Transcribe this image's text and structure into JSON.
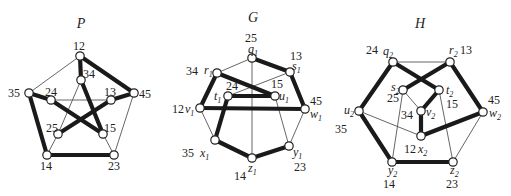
{
  "graphs": [
    {
      "id": "P",
      "title": "P",
      "title_pos": [
        81,
        28
      ],
      "nodes": [
        {
          "id": "12",
          "x": 80,
          "y": 56,
          "num": "12",
          "nx": 73,
          "ny": 50
        },
        {
          "id": "34",
          "x": 81,
          "y": 80,
          "num": "34",
          "nx": 83,
          "ny": 78
        },
        {
          "id": "35",
          "x": 29,
          "y": 93,
          "num": "35",
          "nx": 8,
          "ny": 97
        },
        {
          "id": "24",
          "x": 51,
          "y": 100,
          "num": "24",
          "nx": 45,
          "ny": 96
        },
        {
          "id": "13",
          "x": 111,
          "y": 100,
          "num": "13",
          "nx": 104,
          "ny": 96
        },
        {
          "id": "45",
          "x": 134,
          "y": 93,
          "num": "45",
          "nx": 139,
          "ny": 98
        },
        {
          "id": "25",
          "x": 58,
          "y": 134,
          "num": "25",
          "nx": 46,
          "ny": 132
        },
        {
          "id": "15",
          "x": 103,
          "y": 134,
          "num": "15",
          "nx": 104,
          "ny": 132
        },
        {
          "id": "14",
          "x": 47,
          "y": 155,
          "num": "14",
          "nx": 40,
          "ny": 170
        },
        {
          "id": "23",
          "x": 114,
          "y": 155,
          "num": "23",
          "nx": 108,
          "ny": 170
        }
      ],
      "thick": [
        [
          "12",
          "34"
        ],
        [
          "12",
          "45"
        ],
        [
          "45",
          "13"
        ],
        [
          "13",
          "25"
        ],
        [
          "35",
          "24"
        ],
        [
          "24",
          "15"
        ],
        [
          "34",
          "15"
        ],
        [
          "35",
          "14"
        ],
        [
          "14",
          "23"
        ]
      ],
      "thin": [
        [
          "12",
          "35"
        ],
        [
          "45",
          "23"
        ],
        [
          "24",
          "13"
        ],
        [
          "34",
          "25"
        ],
        [
          "25",
          "14"
        ],
        [
          "15",
          "23"
        ]
      ]
    },
    {
      "id": "G",
      "title": "G",
      "title_pos": [
        253,
        22
      ],
      "nodes": [
        {
          "id": "q1",
          "x": 252,
          "y": 58,
          "num": "25",
          "nx": 245,
          "ny": 42,
          "var": "q",
          "vx": 248,
          "vy": 53
        },
        {
          "id": "r1",
          "x": 217,
          "y": 73,
          "num": "34",
          "nx": 186,
          "ny": 75,
          "var": "r",
          "vx": 204,
          "vy": 74
        },
        {
          "id": "s1",
          "x": 290,
          "y": 72,
          "num": "13",
          "nx": 290,
          "ny": 60,
          "var": "s",
          "vx": 292,
          "vy": 70
        },
        {
          "id": "t1",
          "x": 228,
          "y": 96,
          "num": "24",
          "nx": 226,
          "ny": 90,
          "var": "t",
          "vx": 214,
          "vy": 100
        },
        {
          "id": "u1",
          "x": 275,
          "y": 96,
          "num": "15",
          "nx": 271,
          "ny": 88,
          "var": "u",
          "vx": 279,
          "vy": 100
        },
        {
          "id": "v1",
          "x": 200,
          "y": 108,
          "num": "12",
          "nx": 172,
          "ny": 113,
          "var": "v",
          "vx": 185,
          "vy": 113
        },
        {
          "id": "w1",
          "x": 305,
          "y": 109,
          "num": "45",
          "nx": 310,
          "ny": 105,
          "var": "w",
          "vx": 310,
          "vy": 118
        },
        {
          "id": "x1",
          "x": 215,
          "y": 140,
          "num": "35",
          "nx": 182,
          "ny": 157,
          "var": "x",
          "vx": 200,
          "vy": 157
        },
        {
          "id": "y1",
          "x": 289,
          "y": 146,
          "num": "23",
          "nx": 294,
          "ny": 171,
          "var": "y",
          "vx": 293,
          "vy": 156
        },
        {
          "id": "z1",
          "x": 252,
          "y": 158,
          "num": "14",
          "nx": 234,
          "ny": 180,
          "var": "z",
          "vx": 248,
          "vy": 172
        }
      ],
      "thick": [
        [
          "q1",
          "s1"
        ],
        [
          "r1",
          "u1"
        ],
        [
          "r1",
          "v1"
        ],
        [
          "s1",
          "w1"
        ],
        [
          "t1",
          "u1"
        ],
        [
          "v1",
          "w1"
        ],
        [
          "t1",
          "x1"
        ],
        [
          "x1",
          "z1"
        ],
        [
          "z1",
          "y1"
        ]
      ],
      "thin": [
        [
          "q1",
          "r1"
        ],
        [
          "q1",
          "z1"
        ],
        [
          "s1",
          "t1"
        ],
        [
          "v1",
          "x1"
        ],
        [
          "u1",
          "y1"
        ],
        [
          "w1",
          "y1"
        ]
      ]
    },
    {
      "id": "H",
      "title": "H",
      "title_pos": [
        420,
        28
      ],
      "nodes": [
        {
          "id": "q2",
          "x": 393,
          "y": 62,
          "num": "24",
          "nx": 366,
          "ny": 54,
          "var": "q",
          "vx": 383,
          "vy": 55
        },
        {
          "id": "r2",
          "x": 450,
          "y": 62,
          "num": "13",
          "nx": 460,
          "ny": 54,
          "var": "r",
          "vx": 449,
          "vy": 54
        },
        {
          "id": "s2",
          "x": 403,
          "y": 90,
          "num": "25",
          "nx": 387,
          "ny": 102,
          "var": "s",
          "vx": 391,
          "vy": 91
        },
        {
          "id": "t2",
          "x": 439,
          "y": 90,
          "num": "15",
          "nx": 446,
          "ny": 108,
          "var": "t",
          "vx": 446,
          "vy": 94
        },
        {
          "id": "u2",
          "x": 359,
          "y": 111,
          "num": "35",
          "nx": 335,
          "ny": 133,
          "var": "u",
          "vx": 344,
          "vy": 114
        },
        {
          "id": "v2",
          "x": 421,
          "y": 111,
          "num": "34",
          "nx": 401,
          "ny": 119,
          "var": "v",
          "vx": 426,
          "vy": 116
        },
        {
          "id": "w2",
          "x": 483,
          "y": 112,
          "num": "45",
          "nx": 488,
          "ny": 104,
          "var": "w",
          "vx": 489,
          "vy": 117
        },
        {
          "id": "x2",
          "x": 421,
          "y": 136,
          "num": "12",
          "nx": 404,
          "ny": 153,
          "var": "x",
          "vx": 418,
          "vy": 153
        },
        {
          "id": "y2",
          "x": 392,
          "y": 162,
          "num": "14",
          "nx": 383,
          "ny": 188,
          "var": "y",
          "vx": 388,
          "vy": 174
        },
        {
          "id": "z2",
          "x": 453,
          "y": 162,
          "num": "23",
          "nx": 446,
          "ny": 188,
          "var": "z",
          "vx": 450,
          "vy": 174
        }
      ],
      "thick": [
        [
          "q2",
          "u2"
        ],
        [
          "u2",
          "y2"
        ],
        [
          "y2",
          "z2"
        ],
        [
          "q2",
          "t2"
        ],
        [
          "r2",
          "s2"
        ],
        [
          "r2",
          "w2"
        ],
        [
          "t2",
          "v2"
        ],
        [
          "v2",
          "x2"
        ],
        [
          "x2",
          "w2"
        ]
      ],
      "thin": [
        [
          "q2",
          "r2"
        ],
        [
          "s2",
          "v2"
        ],
        [
          "s2",
          "y2"
        ],
        [
          "t2",
          "z2"
        ],
        [
          "u2",
          "x2"
        ],
        [
          "w2",
          "z2"
        ]
      ]
    }
  ]
}
